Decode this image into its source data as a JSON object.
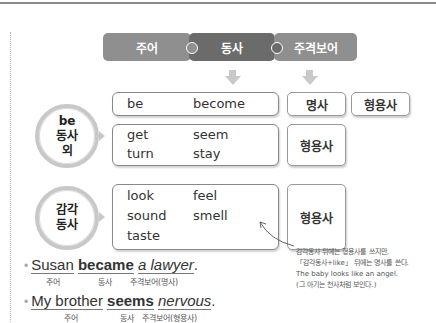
{
  "diagram": {
    "header_pills": [
      {
        "label": "주어",
        "color": "#8f8f8f"
      },
      {
        "label": "동사",
        "color": "#6b6b6b"
      },
      {
        "label": "주격보어",
        "color": "#8f8f8f"
      }
    ],
    "groups": [
      {
        "circle_lines": [
          "be",
          "동사",
          "외"
        ],
        "rows": [
          {
            "verbs": [
              "be",
              "become"
            ],
            "complements": [
              "명사",
              "형용사"
            ]
          },
          {
            "verbs": [
              "get",
              "seem",
              "turn",
              "stay"
            ],
            "complements": [
              "형용사"
            ]
          }
        ]
      },
      {
        "circle_lines": [
          "감각",
          "동사"
        ],
        "rows": [
          {
            "verbs": [
              "look",
              "feel",
              "sound",
              "smell",
              "taste"
            ],
            "complements": [
              "형용사"
            ]
          }
        ]
      }
    ]
  },
  "examples": [
    {
      "bullet": "•",
      "parts": {
        "subject": "Susan",
        "verb": "became",
        "complement": "a lawyer",
        "end": "."
      },
      "labels": {
        "subject": "주어",
        "verb": "동사",
        "complement": "주격보어(명사)"
      }
    },
    {
      "bullet": "•",
      "parts": {
        "subject": "My brother",
        "verb": "seems",
        "complement": "nervous",
        "end": "."
      },
      "labels": {
        "subject": "주어",
        "verb": "동사",
        "complement": "주격보어(형용사)"
      }
    }
  ],
  "note": {
    "lines": [
      "감각동사 뒤에는 형용사를 쓰지만,",
      "「감각동사+like」 뒤에는 명사를 쓴다.",
      "The baby looks like an angel.",
      "(그 아기는 천사처럼 보인다.)"
    ]
  }
}
